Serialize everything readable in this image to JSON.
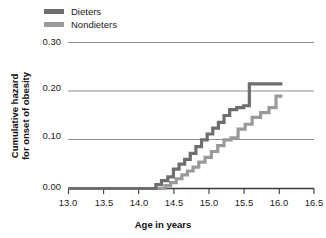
{
  "chart_data": {
    "type": "line",
    "title": "",
    "xlabel": "Age in years",
    "ylabel": "Cumulative hazard\nfor onset of obesity",
    "ylabel_line1": "Cumulative hazard",
    "ylabel_line2": "for onset of obesity",
    "xlim": [
      13.0,
      16.5
    ],
    "ylim": [
      0.0,
      0.3
    ],
    "xticks": [
      "13.0",
      "13.5",
      "14.0",
      "14.5",
      "15.0",
      "15.5",
      "16.0",
      "16.5"
    ],
    "xtick_values": [
      13.0,
      13.5,
      14.0,
      14.5,
      15.0,
      15.5,
      16.0,
      16.5
    ],
    "yticks": [
      "0.00",
      "0.10",
      "0.20",
      "0.30"
    ],
    "ytick_values": [
      0.0,
      0.1,
      0.2,
      0.3
    ],
    "gridlines": [
      0.1,
      0.2,
      0.3
    ],
    "grid": true,
    "legend_position": "top-left",
    "step_style": "post",
    "series": [
      {
        "name": "Dieters",
        "color": "#6e6e6e",
        "x": [
          13.0,
          14.15,
          14.25,
          14.33,
          14.42,
          14.5,
          14.58,
          14.66,
          14.74,
          14.82,
          14.9,
          14.98,
          15.06,
          15.14,
          15.22,
          15.3,
          15.4,
          15.5,
          15.58,
          16.05
        ],
        "y": [
          0.0,
          0.0,
          0.008,
          0.016,
          0.024,
          0.04,
          0.05,
          0.06,
          0.072,
          0.086,
          0.1,
          0.112,
          0.124,
          0.136,
          0.15,
          0.162,
          0.166,
          0.17,
          0.215,
          0.215
        ]
      },
      {
        "name": "Nondieters",
        "color": "#9a9a9a",
        "x": [
          13.0,
          14.28,
          14.38,
          14.46,
          14.54,
          14.62,
          14.7,
          14.78,
          14.86,
          14.95,
          15.04,
          15.13,
          15.22,
          15.32,
          15.42,
          15.52,
          15.62,
          15.74,
          15.86,
          15.96,
          16.05
        ],
        "y": [
          0.0,
          0.0,
          0.006,
          0.012,
          0.02,
          0.028,
          0.036,
          0.044,
          0.054,
          0.064,
          0.076,
          0.088,
          0.1,
          0.104,
          0.122,
          0.132,
          0.146,
          0.156,
          0.166,
          0.19,
          0.19
        ]
      }
    ]
  },
  "legend": {
    "items": [
      {
        "label": "Dieters",
        "color": "#6e6e6e"
      },
      {
        "label": "Nondieters",
        "color": "#9a9a9a"
      }
    ]
  },
  "axes": {
    "axis_color": "#3a3a3a",
    "grid_color": "#8d8d8d"
  }
}
